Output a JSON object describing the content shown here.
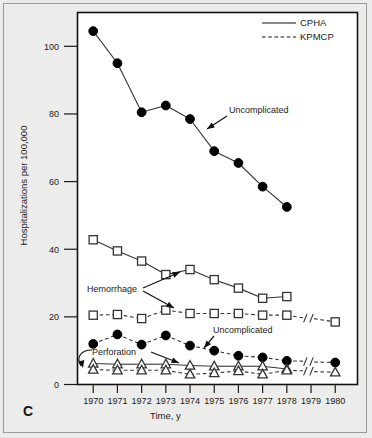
{
  "panel": {
    "label": "C"
  },
  "legend": [
    {
      "label": "CPHA",
      "style": "solid"
    },
    {
      "label": "KPMCP",
      "style": "dashed"
    }
  ],
  "annotations": [
    {
      "name": "uncomplicated-cpha",
      "text": "Uncomplicated"
    },
    {
      "name": "hemorrhage",
      "text": "Hemorrhage"
    },
    {
      "name": "uncomplicated-kpmcp",
      "text": "Uncomplicated"
    },
    {
      "name": "perforation",
      "text": "Perforation"
    }
  ],
  "chart_data": {
    "type": "line",
    "title": "",
    "xlabel": "Time, y",
    "ylabel": "Hospitalizations per 100,000",
    "x": [
      1970,
      1971,
      1972,
      1973,
      1974,
      1975,
      1976,
      1977,
      1978,
      1980
    ],
    "xticks": [
      1970,
      1971,
      1972,
      1973,
      1974,
      1975,
      1976,
      1977,
      1978,
      1979,
      1980
    ],
    "xlim": [
      1969.5,
      1980.5
    ],
    "yticks": [
      0,
      20,
      40,
      60,
      80,
      100
    ],
    "ylim": [
      0,
      110
    ],
    "grid": false,
    "legend_position": "top-right",
    "axis_break": "between 1978 and 1980",
    "series": [
      {
        "name": "Uncomplicated",
        "source": "CPHA",
        "line": "solid",
        "marker": "filled-circle",
        "x": [
          1970,
          1971,
          1972,
          1973,
          1974,
          1975,
          1976,
          1977,
          1978
        ],
        "values": [
          104.5,
          95.0,
          80.5,
          82.5,
          78.5,
          69.0,
          65.5,
          58.5,
          52.5
        ]
      },
      {
        "name": "Hemorrhage",
        "source": "CPHA",
        "line": "solid",
        "marker": "open-square",
        "x": [
          1970,
          1971,
          1972,
          1973,
          1974,
          1975,
          1976,
          1977,
          1978
        ],
        "values": [
          42.8,
          39.5,
          36.5,
          32.5,
          34.0,
          31.0,
          28.5,
          25.5,
          26.0
        ]
      },
      {
        "name": "Hemorrhage",
        "source": "KPMCP",
        "line": "dashed",
        "marker": "open-square",
        "x": [
          1970,
          1971,
          1972,
          1973,
          1974,
          1975,
          1976,
          1977,
          1978,
          1980
        ],
        "values": [
          20.5,
          20.7,
          19.5,
          22.0,
          21.0,
          21.0,
          21.0,
          20.5,
          20.5,
          18.5
        ]
      },
      {
        "name": "Uncomplicated",
        "source": "KPMCP",
        "line": "dashed",
        "marker": "filled-circle",
        "x": [
          1970,
          1971,
          1972,
          1973,
          1974,
          1975,
          1976,
          1977,
          1978,
          1980
        ],
        "values": [
          12.0,
          14.8,
          11.8,
          14.5,
          11.5,
          10.0,
          8.5,
          8.0,
          7.0,
          6.5
        ]
      },
      {
        "name": "Perforation",
        "source": "CPHA",
        "line": "solid",
        "marker": "open-triangle",
        "x": [
          1970,
          1971,
          1972,
          1973,
          1974,
          1975,
          1976,
          1977,
          1978
        ],
        "values": [
          6.2,
          6.0,
          6.0,
          6.0,
          5.6,
          5.4,
          5.4,
          5.4,
          4.6
        ]
      },
      {
        "name": "Perforation",
        "source": "KPMCP",
        "line": "dashed",
        "marker": "open-triangle",
        "x": [
          1970,
          1971,
          1972,
          1973,
          1974,
          1975,
          1976,
          1977,
          1978,
          1980
        ],
        "values": [
          4.4,
          4.2,
          4.2,
          4.2,
          3.0,
          3.4,
          4.0,
          3.0,
          4.2,
          3.6
        ]
      }
    ]
  }
}
